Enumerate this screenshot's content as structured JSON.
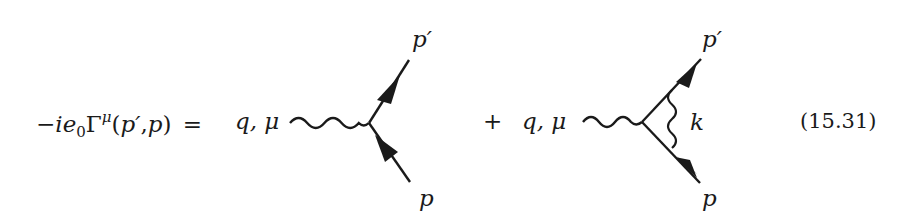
{
  "equation": {
    "lhs": {
      "minus": "−",
      "i": "i",
      "e": "e",
      "e_sub": "0",
      "gamma": "Γ",
      "gamma_sup": "μ",
      "open_paren": "(",
      "p_prime": "p′",
      "comma": ",",
      "p": "p",
      "close_paren": ")",
      "equals": "="
    },
    "term1": {
      "photon_label": "q, μ",
      "outgoing_label": "p′",
      "incoming_label": "p"
    },
    "plus": "+",
    "term2": {
      "photon_label": "q, μ",
      "outgoing_label": "p′",
      "incoming_label": "p",
      "loop_label": "k"
    },
    "number": "(15.31)"
  },
  "colors": {
    "ink": "#1a1a1a",
    "background": "#ffffff"
  }
}
